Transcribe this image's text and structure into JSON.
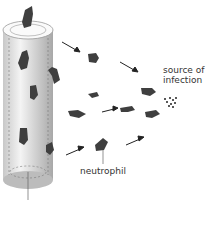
{
  "diagram": {
    "labels": {
      "source": "source of\ninfection",
      "source_line1": "source of",
      "source_line2": "infection",
      "neutrophil": "neutrophil"
    },
    "elements": {
      "vessel": "blood vessel (cylinder)",
      "cells": "neutrophils migrating out of vessel",
      "arrows": "direction of migration toward source",
      "infection": "bacteria cluster"
    },
    "colors": {
      "cell": "#3f3f3f",
      "vessel_light": "#f2f2f2",
      "vessel_dark": "#b8b8b8",
      "text": "#333333"
    }
  }
}
